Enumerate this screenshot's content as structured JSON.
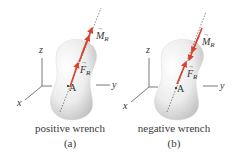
{
  "colors": {
    "arrow": "#d9412b",
    "text": "#333333",
    "axis": "#555555",
    "body_fill_light": "#f7f7f7",
    "body_fill_dark": "#bdbdbd"
  },
  "panels": [
    {
      "id": "a",
      "caption": "positive wrench",
      "sublabel": "(a)",
      "axes": {
        "x": "x",
        "y": "y",
        "z": "z"
      },
      "point_label": "A",
      "force_label": {
        "symbol": "F",
        "subscript": "R"
      },
      "moment_label": {
        "symbol": "M",
        "subscript": "R"
      },
      "moment_direction": "away from body (same as force)"
    },
    {
      "id": "b",
      "caption": "negative wrench",
      "sublabel": "(b)",
      "axes": {
        "x": "x",
        "y": "y",
        "z": "z"
      },
      "point_label": "A",
      "force_label": {
        "symbol": "F",
        "subscript": "R"
      },
      "moment_label": {
        "symbol": "M",
        "subscript": "R"
      },
      "moment_direction": "toward body (opposite to force)"
    }
  ]
}
